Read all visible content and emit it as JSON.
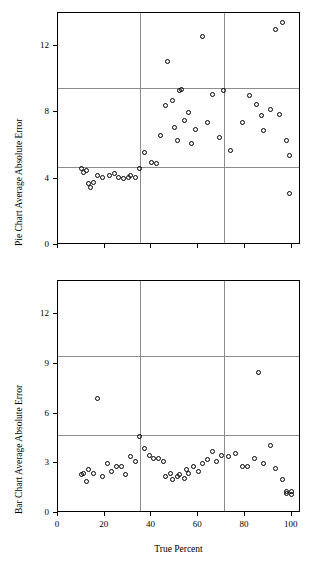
{
  "figure": {
    "background": "#ffffff",
    "point_color": "#000000",
    "grid_color": "#8c8c8c",
    "axis_color": "#000000"
  },
  "xaxis": {
    "label": "True Percent",
    "ticks": [
      "0",
      "20",
      "40",
      "60",
      "80",
      "100"
    ],
    "range": [
      0,
      104
    ]
  },
  "chart_data": [
    {
      "type": "scatter",
      "title": "",
      "xlabel": "True Percent",
      "ylabel": "Pie Chart Average Absolute Error",
      "xlim": [
        0,
        104
      ],
      "ylim": [
        0,
        14
      ],
      "xticks": [
        0,
        20,
        40,
        60,
        80,
        100
      ],
      "yticks": [
        0,
        4,
        8,
        12
      ],
      "ytick_labels": [
        "0",
        "4",
        "8",
        "12"
      ],
      "grid": {
        "horizontal": [
          4.7,
          9.5
        ],
        "vertical": [
          35,
          71
        ]
      },
      "points": [
        {
          "x": 10,
          "y": 4.6
        },
        {
          "x": 11,
          "y": 4.4
        },
        {
          "x": 12,
          "y": 4.5
        },
        {
          "x": 13,
          "y": 3.7
        },
        {
          "x": 14,
          "y": 3.5
        },
        {
          "x": 15,
          "y": 3.8
        },
        {
          "x": 17,
          "y": 4.2
        },
        {
          "x": 19,
          "y": 4.1
        },
        {
          "x": 22,
          "y": 4.2
        },
        {
          "x": 24,
          "y": 4.3
        },
        {
          "x": 26,
          "y": 4.1
        },
        {
          "x": 28,
          "y": 4.0
        },
        {
          "x": 30,
          "y": 4.1
        },
        {
          "x": 31,
          "y": 4.2
        },
        {
          "x": 33,
          "y": 4.1
        },
        {
          "x": 35,
          "y": 4.6
        },
        {
          "x": 37,
          "y": 5.6
        },
        {
          "x": 40,
          "y": 5.0
        },
        {
          "x": 42,
          "y": 4.9
        },
        {
          "x": 44,
          "y": 6.6
        },
        {
          "x": 46,
          "y": 8.4
        },
        {
          "x": 47,
          "y": 11.1
        },
        {
          "x": 49,
          "y": 8.7
        },
        {
          "x": 50,
          "y": 7.1
        },
        {
          "x": 51,
          "y": 6.3
        },
        {
          "x": 52,
          "y": 9.3
        },
        {
          "x": 53,
          "y": 9.4
        },
        {
          "x": 54,
          "y": 7.5
        },
        {
          "x": 56,
          "y": 8.0
        },
        {
          "x": 57,
          "y": 6.1
        },
        {
          "x": 59,
          "y": 7.0
        },
        {
          "x": 62,
          "y": 12.6
        },
        {
          "x": 64,
          "y": 7.4
        },
        {
          "x": 66,
          "y": 9.1
        },
        {
          "x": 69,
          "y": 6.5
        },
        {
          "x": 71,
          "y": 9.3
        },
        {
          "x": 74,
          "y": 5.7
        },
        {
          "x": 79,
          "y": 7.4
        },
        {
          "x": 82,
          "y": 9.0
        },
        {
          "x": 85,
          "y": 8.5
        },
        {
          "x": 87,
          "y": 7.8
        },
        {
          "x": 88,
          "y": 6.9
        },
        {
          "x": 91,
          "y": 8.2
        },
        {
          "x": 93,
          "y": 13.0
        },
        {
          "x": 95,
          "y": 7.9
        },
        {
          "x": 96,
          "y": 13.4
        },
        {
          "x": 98,
          "y": 6.3
        },
        {
          "x": 99,
          "y": 5.4
        },
        {
          "x": 99,
          "y": 3.1
        }
      ]
    },
    {
      "type": "scatter",
      "title": "",
      "xlabel": "True Percent",
      "ylabel": "Bar Chart Average Absolute Error",
      "xlim": [
        0,
        104
      ],
      "ylim": [
        0,
        14
      ],
      "xticks": [
        0,
        20,
        40,
        60,
        80,
        100
      ],
      "yticks": [
        0,
        3,
        6,
        9,
        12
      ],
      "ytick_labels": [
        "0",
        "3",
        "6",
        "9",
        "12"
      ],
      "grid": {
        "horizontal": [
          4.7,
          9.5
        ],
        "vertical": [
          35,
          71
        ]
      },
      "points": [
        {
          "x": 10,
          "y": 2.3
        },
        {
          "x": 11,
          "y": 2.4
        },
        {
          "x": 12,
          "y": 1.9
        },
        {
          "x": 13,
          "y": 2.6
        },
        {
          "x": 15,
          "y": 2.4
        },
        {
          "x": 17,
          "y": 6.9
        },
        {
          "x": 19,
          "y": 2.2
        },
        {
          "x": 21,
          "y": 3.0
        },
        {
          "x": 23,
          "y": 2.5
        },
        {
          "x": 25,
          "y": 2.8
        },
        {
          "x": 27,
          "y": 2.8
        },
        {
          "x": 29,
          "y": 2.3
        },
        {
          "x": 31,
          "y": 3.4
        },
        {
          "x": 33,
          "y": 3.1
        },
        {
          "x": 35,
          "y": 4.6
        },
        {
          "x": 37,
          "y": 3.9
        },
        {
          "x": 39,
          "y": 3.5
        },
        {
          "x": 41,
          "y": 3.3
        },
        {
          "x": 43,
          "y": 3.3
        },
        {
          "x": 45,
          "y": 3.1
        },
        {
          "x": 46,
          "y": 2.2
        },
        {
          "x": 48,
          "y": 2.4
        },
        {
          "x": 49,
          "y": 2.0
        },
        {
          "x": 51,
          "y": 2.2
        },
        {
          "x": 52,
          "y": 2.3
        },
        {
          "x": 54,
          "y": 2.1
        },
        {
          "x": 55,
          "y": 2.6
        },
        {
          "x": 56,
          "y": 2.4
        },
        {
          "x": 58,
          "y": 2.8
        },
        {
          "x": 60,
          "y": 2.5
        },
        {
          "x": 62,
          "y": 3.0
        },
        {
          "x": 64,
          "y": 3.2
        },
        {
          "x": 66,
          "y": 3.7
        },
        {
          "x": 68,
          "y": 3.1
        },
        {
          "x": 70,
          "y": 3.5
        },
        {
          "x": 73,
          "y": 3.4
        },
        {
          "x": 76,
          "y": 3.6
        },
        {
          "x": 79,
          "y": 2.8
        },
        {
          "x": 81,
          "y": 2.8
        },
        {
          "x": 84,
          "y": 3.3
        },
        {
          "x": 86,
          "y": 8.5
        },
        {
          "x": 88,
          "y": 3.0
        },
        {
          "x": 91,
          "y": 4.1
        },
        {
          "x": 93,
          "y": 2.7
        },
        {
          "x": 96,
          "y": 2.0
        },
        {
          "x": 98,
          "y": 1.3
        },
        {
          "x": 98,
          "y": 1.2
        },
        {
          "x": 100,
          "y": 1.3
        },
        {
          "x": 100,
          "y": 1.1
        }
      ]
    }
  ]
}
